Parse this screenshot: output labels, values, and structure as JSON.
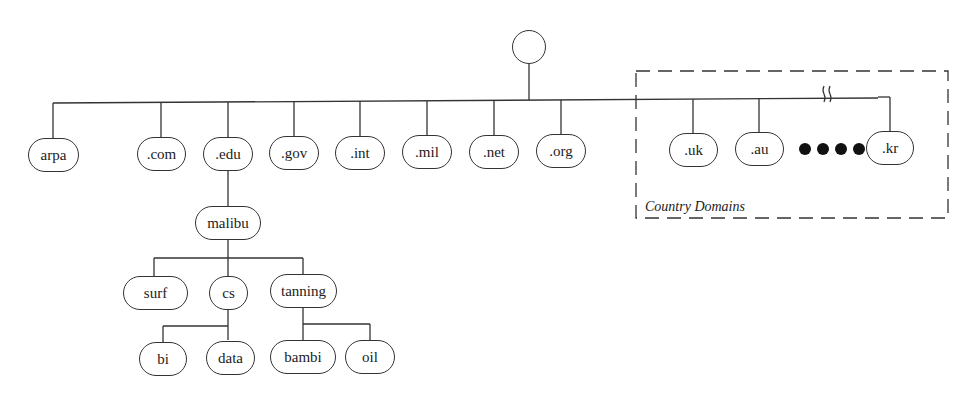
{
  "diagram": {
    "type": "tree",
    "root": {
      "label": ""
    },
    "top_level_domains": [
      {
        "label": "arpa"
      },
      {
        "label": ".com"
      },
      {
        "label": ".edu"
      },
      {
        "label": ".gov"
      },
      {
        "label": ".int"
      },
      {
        "label": ".mil"
      },
      {
        "label": ".net"
      },
      {
        "label": ".org"
      }
    ],
    "country_domains": {
      "caption": "Country Domains",
      "items": [
        {
          "label": ".uk"
        },
        {
          "label": ".au"
        },
        {
          "label": ".kr"
        }
      ],
      "ellipsis_dots": 4,
      "break_mark": "≈"
    },
    "edu_subtree": {
      "label": "malibu",
      "children": [
        {
          "label": "surf",
          "children": []
        },
        {
          "label": "cs",
          "children": [
            {
              "label": "bi"
            },
            {
              "label": "data"
            }
          ]
        },
        {
          "label": "tanning",
          "children": [
            {
              "label": "bambi"
            },
            {
              "label": "oil"
            }
          ]
        }
      ]
    },
    "colors": {
      "line": "#333333",
      "text": "#222222",
      "background": "#ffffff"
    }
  }
}
